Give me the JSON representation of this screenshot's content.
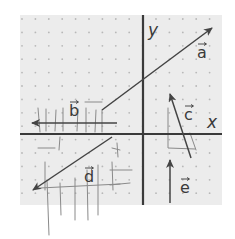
{
  "diagram": {
    "type": "vector-grid",
    "grid": {
      "x0": 20,
      "y0": 15,
      "x1": 222,
      "y1": 205,
      "spacing": 13.4,
      "background": "#ececec",
      "dot_color": "#b8b8b8"
    },
    "axes": {
      "color": "#3a3a3a",
      "y_axis_x": 143,
      "x_axis_y": 134,
      "x_label": "x",
      "y_label": "y"
    },
    "vectors": [
      {
        "name": "a",
        "label": "a",
        "from": [
          102,
          110
        ],
        "to": [
          212,
          28
        ],
        "label_pos": [
          197,
          58
        ]
      },
      {
        "name": "b",
        "label": "b",
        "from": [
          117,
          123
        ],
        "to": [
          32,
          123
        ],
        "label_pos": [
          69,
          116
        ]
      },
      {
        "name": "c",
        "label": "c",
        "from": [
          191,
          158
        ],
        "to": [
          170,
          94
        ],
        "label_pos": [
          184,
          120
        ]
      },
      {
        "name": "d",
        "label": "d",
        "from": [
          112,
          137
        ],
        "to": [
          33,
          190
        ],
        "label_pos": [
          84,
          182
        ]
      },
      {
        "name": "e",
        "label": "e",
        "from": [
          170,
          203
        ],
        "to": [
          170,
          160
        ],
        "label_pos": [
          180,
          193
        ]
      }
    ],
    "vector_color": "#444444",
    "pencil_color": "#8a8a8a"
  }
}
